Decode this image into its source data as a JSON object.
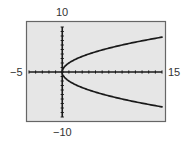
{
  "chart_data": {
    "type": "line",
    "title": "",
    "xlabel": "",
    "ylabel": "",
    "xlim": [
      -5,
      15
    ],
    "ylim": [
      -10,
      10
    ],
    "xscale_ticks": 1,
    "yscale_ticks": 1,
    "grid": false,
    "legend": null,
    "window_labels": {
      "xmin": "−5",
      "xmax": "15",
      "ymin": "−10",
      "ymax": "10"
    },
    "series": [
      {
        "name": "upper branch (y = 2√x)",
        "x": [
          0,
          0.25,
          1,
          2,
          3,
          4,
          5,
          6,
          7,
          8,
          9,
          10,
          11,
          12,
          13,
          14,
          15
        ],
        "y": [
          0,
          1,
          2,
          2.83,
          3.46,
          4,
          4.47,
          4.9,
          5.29,
          5.66,
          6,
          6.32,
          6.63,
          6.93,
          7.21,
          7.48,
          7.75
        ]
      },
      {
        "name": "lower branch (y = −2√x)",
        "x": [
          0,
          0.25,
          1,
          2,
          3,
          4,
          5,
          6,
          7,
          8,
          9,
          10,
          11,
          12,
          13,
          14,
          15
        ],
        "y": [
          0,
          -1,
          -2,
          -2.83,
          -3.46,
          -4,
          -4.47,
          -4.9,
          -5.29,
          -5.66,
          -6,
          -6.32,
          -6.63,
          -6.93,
          -7.21,
          -7.48,
          -7.75
        ]
      }
    ]
  },
  "colors": {
    "screen_bg": "#e6e6e6",
    "frame": "#666666",
    "axes": "#1a1a1a",
    "curve": "#1a1a1a",
    "label": "#333333"
  }
}
